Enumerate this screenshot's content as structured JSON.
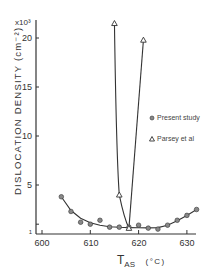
{
  "chart_data": {
    "type": "line",
    "title": "",
    "xlabel": "T_AS (°C)",
    "xlabel_main": "T",
    "xlabel_sub": "AS",
    "xlabel_unit": "(°C)",
    "ylabel": "DISLOCATION DENSITY (cm⁻²)",
    "y_multiplier": "x10³",
    "xlim": [
      598,
      633
    ],
    "ylim": [
      1,
      23
    ],
    "x_ticks": [
      600,
      610,
      620,
      630
    ],
    "y_ticks": [
      1,
      5,
      10,
      15,
      20
    ],
    "x_tick_labels": [
      "600",
      "610",
      "620",
      "630"
    ],
    "y_tick_labels": [
      "1",
      "5",
      "10",
      "15",
      "20"
    ],
    "grid": false,
    "legend_position": "right-middle",
    "series": [
      {
        "name": "Present study",
        "marker": "filled-circle",
        "x": [
          604,
          606,
          608,
          610,
          612,
          614,
          616,
          618,
          620,
          622,
          624,
          626,
          628,
          630,
          632
        ],
        "y": [
          3.8,
          2.3,
          1.2,
          1.0,
          1.4,
          0.7,
          0.7,
          0.7,
          0.9,
          0.6,
          0.5,
          0.9,
          1.4,
          1.9,
          2.5
        ]
      },
      {
        "name": "Parsey et al",
        "marker": "open-triangle",
        "x": [
          615,
          616,
          618,
          621
        ],
        "y": [
          21.5,
          4.0,
          0.6,
          19.8
        ]
      }
    ]
  },
  "labels": {
    "multiplier": "x10³",
    "ylabel": "DISLOCATION DENSITY (cm⁻²)",
    "xlabel_main": "T",
    "xlabel_sub": "AS",
    "xlabel_unit": "(°C)",
    "legend_present": "Present study",
    "legend_parsey": "Parsey et al",
    "tick_y_1": "1",
    "tick_y_5": "5",
    "tick_y_10": "10",
    "tick_y_15": "15",
    "tick_y_20": "20",
    "tick_x_600": "600",
    "tick_x_610": "610",
    "tick_x_620": "620",
    "tick_x_630": "630"
  },
  "colors": {
    "ink": "#333333",
    "marker_fill": "#888888",
    "background": "#ffffff"
  }
}
